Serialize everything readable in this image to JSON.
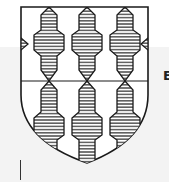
{
  "image": {
    "subject": "heraldic shield",
    "description": "Shield with a pattern of hatched (horizontal-lined) vertical pieces with pointed ends, divided by a horizontal line across the middle",
    "columns_top": 3,
    "rows": 2,
    "hatch": "horizontal lines",
    "colors": {
      "outline": "#1a1a1a",
      "background": "#ffffff",
      "band": "#f3f3f3"
    }
  },
  "side_text": {
    "partial_glyph": "E"
  }
}
